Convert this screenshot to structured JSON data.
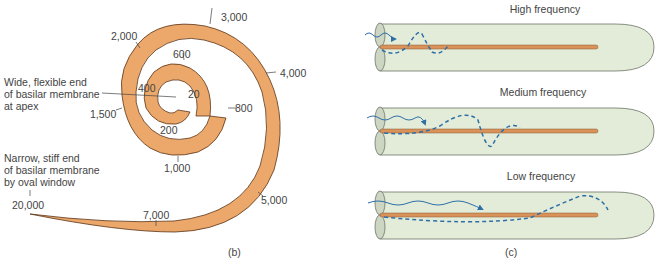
{
  "panel_b": {
    "caption": "(b)",
    "apex_label": [
      "Wide, flexible end",
      "of basilar membrane",
      "at apex"
    ],
    "base_label": [
      "Narrow, stiff end",
      "of basilar membrane",
      "by oval window"
    ],
    "frequency_labels": {
      "f20": "20",
      "f200": "200",
      "f400": "400",
      "f600": "600",
      "f800": "800",
      "f1000": "1,000",
      "f1500": "1,500",
      "f2000": "2,000",
      "f3000": "3,000",
      "f4000": "4,000",
      "f5000": "5,000",
      "f7000": "7,000",
      "f20000": "20,000"
    }
  },
  "panel_c": {
    "caption": "(c)",
    "rows": [
      {
        "title": "High frequency"
      },
      {
        "title": "Medium frequency"
      },
      {
        "title": "Low frequency"
      }
    ]
  },
  "colors": {
    "membrane_fill": "#eba86a",
    "membrane_stroke": "#5a3418",
    "tube_fill": "#e3ecd8",
    "tube_stroke": "#6c7366",
    "wave": "#2f6fa8",
    "rod": "#d9935a"
  }
}
